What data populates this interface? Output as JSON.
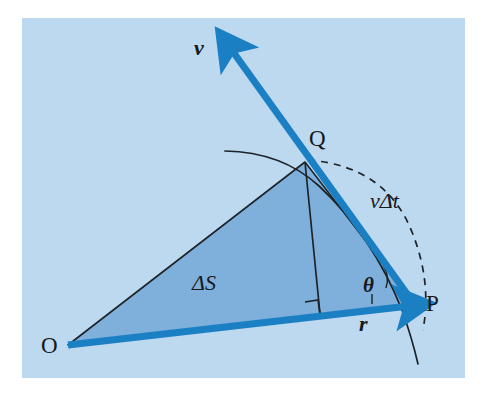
{
  "figure": {
    "kind": "physics-vector-diagram",
    "canvas": {
      "width": 488,
      "height": 407
    }
  },
  "colors": {
    "page_background": "#ffffff",
    "panel_background": "#bcd9ef",
    "triangle_fill": "#7fb0dc",
    "vector_blue": "#1b7fc4",
    "line_dark": "#1d2328",
    "label_text": "#17181a"
  },
  "panel": {
    "x": 22,
    "y": 18,
    "width": 443,
    "height": 360
  },
  "points": {
    "O": {
      "label": "O",
      "x": 68,
      "y": 345,
      "label_x": 41,
      "label_y": 334
    },
    "P": {
      "label": "P",
      "x": 415,
      "y": 305,
      "label_x": 426,
      "label_y": 292
    },
    "Q": {
      "label": "Q",
      "x": 305,
      "y": 162,
      "label_x": 309,
      "label_y": 127
    }
  },
  "vectors": [
    {
      "name": "velocity-vector",
      "label": "v",
      "label_x": 194,
      "label_y": 37,
      "from_x": 415,
      "from_y": 305,
      "to_x": 228,
      "to_y": 45,
      "color": "#1b7fc4",
      "style": "bold-italic"
    },
    {
      "name": "radius-vector",
      "label": "r",
      "label_x": 359,
      "label_y": 313,
      "from_x": 68,
      "from_y": 345,
      "to_x": 415,
      "to_y": 305,
      "color": "#1b7fc4",
      "style": "bold-italic"
    }
  ],
  "annotations": [
    {
      "name": "swept-area-label",
      "label": "ΔS",
      "x": 192,
      "y": 272,
      "style": "italic"
    },
    {
      "name": "chord-length-label",
      "label": "vΔt",
      "x": 370,
      "y": 190,
      "style": "italic"
    },
    {
      "name": "angle-label",
      "label": "θ",
      "x": 363,
      "y": 275,
      "style": "bold-italic"
    }
  ],
  "shapes": {
    "triangle": {
      "name": "swept-area-triangle",
      "vertices": "68,345 305,162 415,305",
      "fill": "#7fb0dc",
      "stroke": "#1d2328"
    },
    "orbit_arc": {
      "name": "orbit-arc-solid",
      "description": "solid circular path through Q and P",
      "dash": "none"
    },
    "chord_arc": {
      "name": "chord-arc-dashed",
      "description": "dashed arc from Q bulging right past P marking vΔt",
      "dash": "7 6"
    },
    "altitude": {
      "name": "altitude-line",
      "from_x": 305,
      "from_y": 162,
      "to_x": 320,
      "to_y": 314
    },
    "right_angle": {
      "name": "right-angle-marker",
      "x": 307,
      "y": 301,
      "size": 14
    },
    "angle_arc": {
      "name": "angle-arc-theta",
      "description": "small arc between r and v at P"
    }
  }
}
